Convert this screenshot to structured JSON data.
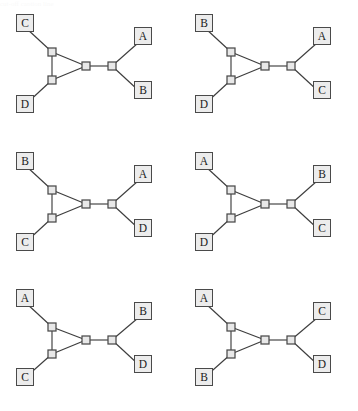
{
  "figure": {
    "type": "network-diagram-grid",
    "rows": 3,
    "columns": 2,
    "panel_count": 6,
    "colors": {
      "leaf_box_fill": "#ececec",
      "leaf_box_border": "#4a4a4a",
      "internal_node_fill": "#e8e8e8",
      "internal_node_border": "#4a4a4a",
      "edge": "#3d3d3d",
      "background": "#ffffff",
      "label_text": "#1a1a1a"
    },
    "geometry": {
      "leaf_box_size": 18,
      "internal_node_size": 8,
      "topology_note": "Two triangle nodes on the left join a hub node; hub connects via a horizontal edge to a second hub carrying two right leaves."
    },
    "top_artifact_text": "cut-off caption line"
  },
  "panels": [
    {
      "id": "panel-1",
      "index": 1,
      "leaves": {
        "top_left": "C",
        "bottom_left": "D",
        "top_right": "A",
        "bottom_right": "B"
      }
    },
    {
      "id": "panel-2",
      "index": 2,
      "leaves": {
        "top_left": "B",
        "bottom_left": "D",
        "top_right": "A",
        "bottom_right": "C"
      }
    },
    {
      "id": "panel-3",
      "index": 3,
      "leaves": {
        "top_left": "B",
        "bottom_left": "C",
        "top_right": "A",
        "bottom_right": "D"
      }
    },
    {
      "id": "panel-4",
      "index": 4,
      "leaves": {
        "top_left": "A",
        "bottom_left": "D",
        "top_right": "B",
        "bottom_right": "C"
      }
    },
    {
      "id": "panel-5",
      "index": 5,
      "leaves": {
        "top_left": "A",
        "bottom_left": "C",
        "top_right": "B",
        "bottom_right": "D"
      }
    },
    {
      "id": "panel-6",
      "index": 6,
      "leaves": {
        "top_left": "A",
        "bottom_left": "B",
        "top_right": "C",
        "bottom_right": "D"
      }
    }
  ]
}
